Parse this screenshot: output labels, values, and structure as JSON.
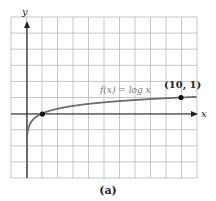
{
  "chart_data": {
    "type": "line",
    "title": "",
    "function_label": "f(x) = log x",
    "xlabel": "x",
    "ylabel": "y",
    "xlim": [
      -1,
      11
    ],
    "ylim": [
      -4,
      6
    ],
    "grid": true,
    "grid_step": 1,
    "series": [
      {
        "name": "f(x) = log x",
        "x": [
          0.05,
          0.1,
          0.2,
          0.5,
          1,
          2,
          3,
          4,
          5,
          6,
          7,
          8,
          9,
          10,
          11
        ],
        "y": [
          -1.301,
          -1,
          -0.699,
          -0.301,
          0,
          0.301,
          0.477,
          0.602,
          0.699,
          0.778,
          0.845,
          0.903,
          0.954,
          1,
          1.041
        ]
      }
    ],
    "marked_points": [
      {
        "x": 1,
        "y": 0,
        "label": ""
      },
      {
        "x": 10,
        "y": 1,
        "label": "(10, 1)"
      }
    ],
    "annotations": [
      "f(x) = log x",
      "(10, 1)"
    ],
    "caption": "(a)"
  },
  "labels": {
    "function": "f(x) = log x",
    "point": "(10, 1)",
    "x_axis": "x",
    "y_axis": "y",
    "caption": "(a)"
  },
  "colors": {
    "grid": "#b9b9b9",
    "axes": "#222222",
    "curve": "#6e6e6e",
    "point": "#111111"
  }
}
